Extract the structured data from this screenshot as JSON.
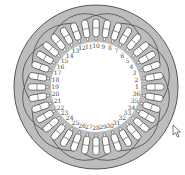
{
  "diagram": {
    "type": "stator-winding",
    "slot_count": 36,
    "coil_group_count": 12,
    "center": [
      96,
      87
    ],
    "outer_radius": 82,
    "slot_outer_radius": 68,
    "slot_inner_radius": 50,
    "bore_radius": 45,
    "label_radius": 41,
    "start_angle_deg": 0,
    "direction": "counterclockwise",
    "slot_labels": [
      "1",
      "2",
      "3",
      "4",
      "5",
      "6",
      "7",
      "8",
      "9",
      "10",
      "11",
      "12",
      "13",
      "14",
      "15",
      "16",
      "17",
      "18",
      "19",
      "20",
      "21",
      "22",
      "23",
      "24",
      "25",
      "26",
      "27",
      "28",
      "29",
      "30",
      "31",
      "32",
      "33",
      "34",
      "35",
      "36"
    ],
    "colors": {
      "core_fill": "#bdbdbd",
      "outline": "#555555",
      "slot_fill": "#ffffff",
      "bore_fill": "#ffffff",
      "label": "#444444"
    }
  },
  "cursor": {
    "x": 172,
    "y": 124,
    "icon": "arrow-pointer"
  }
}
